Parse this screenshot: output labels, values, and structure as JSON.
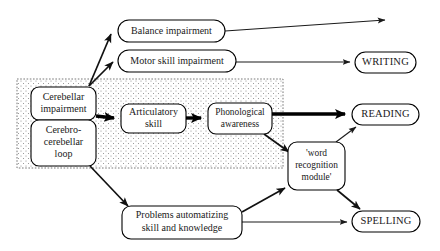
{
  "figure": {
    "background_color": "#ffffff",
    "ink_color": "#1a1a1a"
  },
  "shaded_region": {
    "name": "cerebellar-core-region",
    "fill_style": "stipple-dots",
    "border_style": "dotted",
    "x": 17,
    "y": 79,
    "width": 266,
    "height": 89
  },
  "nodes": [
    {
      "id": "cerebellar-impairment",
      "label_lines": [
        "Cerebellar",
        "impairment"
      ],
      "x": 31,
      "y": 87,
      "width": 65,
      "height": 33,
      "size": "sz-10"
    },
    {
      "id": "cerebro-cerebellar-loop",
      "label_lines": [
        "Cerebro-",
        "cerebellar",
        "loop"
      ],
      "x": 31,
      "y": 120,
      "width": 65,
      "height": 46,
      "size": "sz-10"
    },
    {
      "id": "articulatory-skill",
      "label_lines": [
        "Articulatory",
        "skill"
      ],
      "x": 121,
      "y": 104,
      "width": 65,
      "height": 29,
      "size": "sz-10"
    },
    {
      "id": "phonological-awareness",
      "label_lines": [
        "Phonological",
        "awareness"
      ],
      "x": 208,
      "y": 103,
      "width": 64,
      "height": 31,
      "size": "sz-9"
    },
    {
      "id": "balance-impairment",
      "label_lines": [
        "Balance impairment"
      ],
      "x": 118,
      "y": 20,
      "width": 107,
      "height": 22,
      "size": "sz-10"
    },
    {
      "id": "motor-skill-impairment",
      "label_lines": [
        "Motor skill impairment"
      ],
      "x": 118,
      "y": 50,
      "width": 118,
      "height": 22,
      "size": "sz-10"
    },
    {
      "id": "word-recognition-module",
      "label_lines": [
        "'word",
        "recognition",
        "module'"
      ],
      "x": 288,
      "y": 142,
      "width": 57,
      "height": 48,
      "size": "sz-9"
    },
    {
      "id": "problems-automatizing",
      "label_lines": [
        "Problems automatizing",
        "skill and knowledge"
      ],
      "x": 122,
      "y": 206,
      "width": 120,
      "height": 33,
      "size": "sz-10"
    }
  ],
  "outcomes": [
    {
      "id": "writing",
      "label": "WRITING",
      "x": 355,
      "y": 52,
      "width": 61,
      "height": 21
    },
    {
      "id": "reading",
      "label": "READING",
      "x": 352,
      "y": 104,
      "width": 67,
      "height": 21
    },
    {
      "id": "spelling",
      "label": "SPELLING",
      "x": 352,
      "y": 211,
      "width": 68,
      "height": 21
    }
  ],
  "edges": [
    {
      "id": "edge-core-to-balance",
      "from": "cerebellar-impairment",
      "to": "balance-impairment",
      "weight": "medium"
    },
    {
      "id": "edge-core-to-motor-skill",
      "from": "cerebellar-impairment",
      "to": "motor-skill-impairment",
      "weight": "medium"
    },
    {
      "id": "edge-balance-open",
      "from": "balance-impairment",
      "to": "open-arrow-right",
      "weight": "thin"
    },
    {
      "id": "edge-motor-skill-to-writing",
      "from": "motor-skill-impairment",
      "to": "writing",
      "weight": "thin"
    },
    {
      "id": "edge-cerebellar-to-articulatory",
      "from": "cerebellar-impairment",
      "to": "articulatory-skill",
      "weight": "thick"
    },
    {
      "id": "edge-articulatory-to-phonological",
      "from": "articulatory-skill",
      "to": "phonological-awareness",
      "weight": "thick"
    },
    {
      "id": "edge-phonological-to-reading",
      "from": "phonological-awareness",
      "to": "reading",
      "weight": "thick"
    },
    {
      "id": "edge-phonological-to-word-module",
      "from": "phonological-awareness",
      "to": "word-recognition-module",
      "weight": "medium"
    },
    {
      "id": "edge-loop-to-problems",
      "from": "cerebro-cerebellar-loop",
      "to": "problems-automatizing",
      "weight": "medium"
    },
    {
      "id": "edge-problems-to-word-module",
      "from": "problems-automatizing",
      "to": "word-recognition-module",
      "weight": "medium"
    },
    {
      "id": "edge-problems-to-spelling",
      "from": "problems-automatizing",
      "to": "spelling",
      "weight": "thin"
    },
    {
      "id": "edge-word-module-to-reading",
      "from": "word-recognition-module",
      "to": "reading",
      "weight": "thin"
    },
    {
      "id": "edge-word-module-to-spelling",
      "from": "word-recognition-module",
      "to": "spelling",
      "weight": "medium"
    }
  ]
}
